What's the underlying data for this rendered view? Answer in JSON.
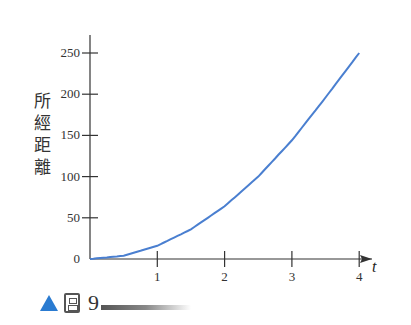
{
  "chart_data": {
    "type": "line",
    "title": "",
    "xlabel": "t",
    "ylabel": "所經距離",
    "xlim": [
      0,
      4.2
    ],
    "ylim": [
      0,
      260
    ],
    "x_ticks": [
      1,
      2,
      3,
      4
    ],
    "x_tick_labels": [
      "1",
      "2",
      "3",
      "4"
    ],
    "y_ticks": [
      0,
      50,
      100,
      150,
      200,
      250
    ],
    "y_tick_labels": [
      "0",
      "50",
      "100",
      "150",
      "200",
      "250"
    ],
    "grid": false,
    "legend": null,
    "series": [
      {
        "name": "distance",
        "color": "#4a7fd0",
        "x": [
          0,
          0.5,
          1,
          1.5,
          2,
          2.5,
          3,
          3.5,
          4
        ],
        "values": [
          0,
          4,
          16,
          36,
          64,
          100,
          144,
          196,
          250
        ]
      }
    ]
  },
  "labels": {
    "ylabel_chars": [
      "所",
      "經",
      "距",
      "離"
    ],
    "xvar": "t"
  },
  "caption": {
    "figure_char": "圖",
    "number": "9"
  },
  "colors": {
    "curve": "#4a7fd0",
    "axis": "#333333",
    "caption_triangle": "#2a7bd1"
  }
}
